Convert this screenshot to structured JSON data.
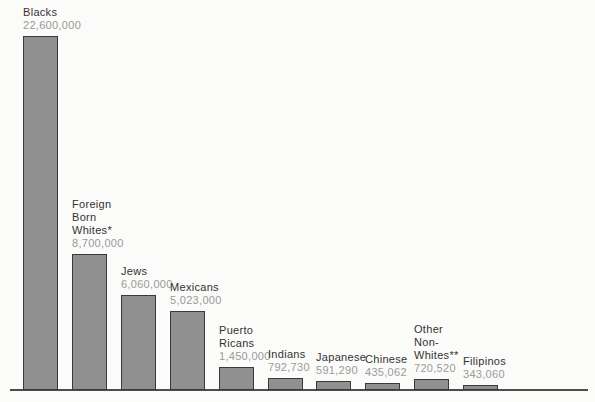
{
  "chart_data": {
    "type": "bar",
    "title": "",
    "xlabel": "",
    "ylabel": "",
    "ylim": [
      0,
      22600000
    ],
    "grid": false,
    "legend": false,
    "axis_style": "baseline-only",
    "categories": [
      "Blacks",
      "Foreign Born Whites*",
      "Jews",
      "Mexicans",
      "Puerto Ricans",
      "Indians",
      "Japanese",
      "Chinese",
      "Other Non-Whites**",
      "Filipinos"
    ],
    "category_lines": [
      "Blacks",
      "Foreign\nBorn\nWhites*",
      "Jews",
      "Mexicans",
      "Puerto\nRicans",
      "Indians",
      "Japanese",
      "Chinese",
      "Other\nNon-\nWhites**",
      "Filipinos"
    ],
    "values": [
      22600000,
      8700000,
      6060000,
      5023000,
      1450000,
      792730,
      591290,
      435062,
      720520,
      343060
    ],
    "value_labels": [
      "22,600,000",
      "8,700,000",
      "6,060,000",
      "5,023,000",
      "1,450,000",
      "792,730",
      "591,290",
      "435,062",
      "720,520",
      "343,060"
    ],
    "colors": {
      "background": "#fbfbf9",
      "bar_fill": "#909090",
      "bar_border": "#3a3a3a",
      "category_text": "#333333",
      "value_text": "#9a9a9a",
      "baseline": "#4d4d4d"
    }
  }
}
